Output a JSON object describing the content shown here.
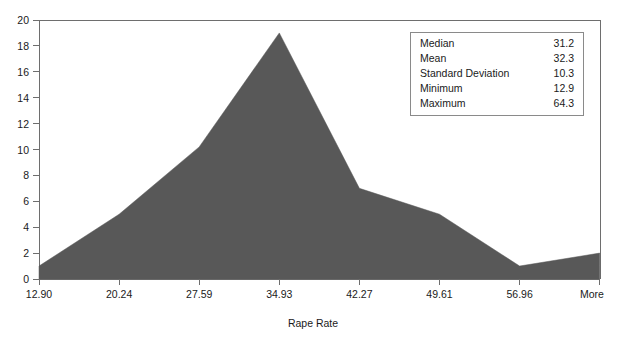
{
  "chart_data": {
    "type": "area",
    "title": "",
    "xlabel": "Rape Rate",
    "ylabel": "",
    "categories": [
      "12.90",
      "20.24",
      "27.59",
      "34.93",
      "42.27",
      "49.61",
      "56.96",
      "More"
    ],
    "values": [
      1,
      5,
      10.2,
      19,
      7,
      5,
      1,
      2
    ],
    "ylim": [
      0,
      20
    ],
    "yticks": [
      "0",
      "2",
      "4",
      "6",
      "8",
      "10",
      "12",
      "14",
      "16",
      "18",
      "20"
    ],
    "ytick_values": [
      0,
      2,
      4,
      6,
      8,
      10,
      12,
      14,
      16,
      18,
      20
    ],
    "grid": false,
    "legend_position": "top-right",
    "series_color": "#585858",
    "axis_color": "#6e6e6e"
  },
  "stats_box": {
    "rows": [
      {
        "label": "Median",
        "value": "31.2"
      },
      {
        "label": "Mean",
        "value": "32.3"
      },
      {
        "label": "Standard Deviation",
        "value": "10.3"
      },
      {
        "label": "Minimum",
        "value": "12.9"
      },
      {
        "label": "Maximum",
        "value": "64.3"
      }
    ]
  },
  "artifacts": {
    "clipped_top_label": ""
  }
}
